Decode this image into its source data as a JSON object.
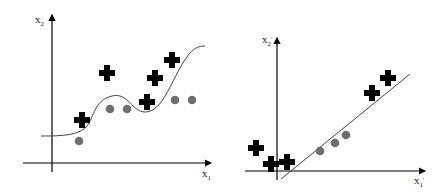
{
  "diagram": {
    "left_plot": {
      "x_axis_label": "x",
      "x_axis_sub": "1",
      "y_axis_label": "x",
      "y_axis_sub": "2",
      "boundary": "nonlinear curve",
      "crosses": [
        [
          82,
          120
        ],
        [
          107,
          73
        ],
        [
          147,
          102
        ],
        [
          155,
          78
        ],
        [
          172,
          60
        ]
      ],
      "circles": [
        [
          79,
          141
        ],
        [
          110,
          109
        ],
        [
          127,
          109
        ],
        [
          175,
          100
        ],
        [
          192,
          100
        ]
      ]
    },
    "right_plot": {
      "x_axis_label": "x",
      "x_axis_sub": "1",
      "x_axis_prime": "'",
      "y_axis_label": "x",
      "y_axis_sub": "2",
      "y_axis_prime": "'",
      "boundary": "straight line",
      "crosses": [
        [
          256,
          148
        ],
        [
          271,
          164
        ],
        [
          287,
          162
        ],
        [
          372,
          93
        ],
        [
          388,
          78
        ]
      ],
      "circles": [
        [
          320,
          151
        ],
        [
          335,
          143
        ],
        [
          346,
          135
        ]
      ]
    },
    "colors": {
      "cross": "#000000",
      "circle": "#6e6e6e",
      "axis": "#000000",
      "boundary": "#444444"
    }
  }
}
